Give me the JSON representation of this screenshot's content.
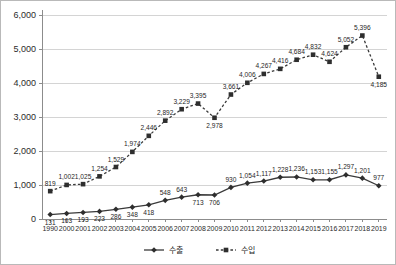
{
  "chart_data": {
    "type": "line",
    "title": "",
    "subtitle": "",
    "xlabel": "",
    "ylabel": "",
    "ylim": [
      0,
      6000
    ],
    "ytick_labels": [
      "0",
      "1,000",
      "2,000",
      "3,000",
      "4,000",
      "5,000",
      "6,000"
    ],
    "ytick_values": [
      0,
      1000,
      2000,
      3000,
      4000,
      5000,
      6000
    ],
    "grid": "horizontal",
    "legend_position": "bottom-center",
    "categories": [
      "1990",
      "2000",
      "2001",
      "2002",
      "2003",
      "2004",
      "2005",
      "2006",
      "2007",
      "2008",
      "2009",
      "2010",
      "2011",
      "2012",
      "2013",
      "2014",
      "2015",
      "2016",
      "2017",
      "2018",
      "2019"
    ],
    "series": [
      {
        "name": "수출",
        "marker": "diamond",
        "line_style": "solid",
        "color": "#3a3a3a",
        "values": [
          131,
          163,
          193,
          223,
          286,
          348,
          418,
          548,
          643,
          713,
          706,
          930,
          1054,
          1117,
          1228,
          1236,
          1153,
          1155,
          1297,
          1201,
          977
        ],
        "labels": [
          "131",
          "163",
          "193",
          "223",
          "286",
          "348",
          "418",
          "548",
          "643",
          "713",
          "706",
          "930",
          "1,054",
          "1,117",
          "1,228",
          "1,236",
          "1,153",
          "1,155",
          "1,297",
          "1,201",
          "977"
        ],
        "label_positions": [
          "below",
          "below",
          "below",
          "below",
          "below",
          "below",
          "below",
          "above",
          "above",
          "below",
          "below",
          "above",
          "above",
          "above",
          "above",
          "above",
          "above",
          "above",
          "above",
          "above",
          "above"
        ]
      },
      {
        "name": "수입",
        "marker": "square",
        "line_style": "dashed",
        "color": "#3a3a3a",
        "values": [
          819,
          1002,
          1025,
          1254,
          1529,
          1974,
          2446,
          2892,
          3229,
          3395,
          2978,
          3661,
          4006,
          4267,
          4416,
          4684,
          4832,
          4624,
          5052,
          5396,
          4185
        ],
        "labels": [
          "819",
          "1,002",
          "1,025",
          "1,254",
          "1,529",
          "1,974",
          "2,446",
          "2,892",
          "3,229",
          "3,395",
          "2,978",
          "3,661",
          "4,006",
          "4,267",
          "4,416",
          "4,684",
          "4,832",
          "4,624",
          "5,052",
          "5,396",
          "4,185"
        ],
        "label_positions": [
          "above",
          "above",
          "above",
          "above",
          "above",
          "above",
          "above",
          "above",
          "above",
          "above",
          "below",
          "above",
          "above",
          "above",
          "above",
          "above",
          "above",
          "above",
          "above",
          "above",
          "below"
        ]
      }
    ],
    "legend": [
      {
        "label": "수출",
        "marker": "diamond",
        "line_style": "solid"
      },
      {
        "label": "수입",
        "marker": "square",
        "line_style": "dashed"
      }
    ]
  }
}
